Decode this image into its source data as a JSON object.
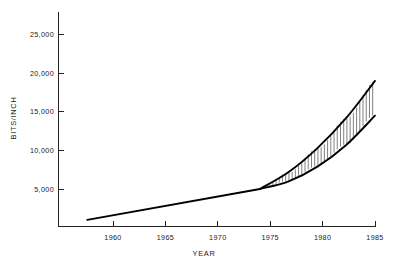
{
  "chart_data": {
    "type": "line",
    "title": "",
    "xlabel": "YEAR",
    "ylabel": "BITS/INCH",
    "xlim": [
      1957.5,
      1985
    ],
    "ylim": [
      0,
      27000
    ],
    "xticks": [
      1960,
      1965,
      1970,
      1975,
      1980,
      1985
    ],
    "xtick_labels": [
      "1960",
      "1965",
      "1970",
      "1975",
      "1980",
      "1985"
    ],
    "yticks": [
      5000,
      10000,
      15000,
      20000,
      25000
    ],
    "ytick_labels": [
      "5,000",
      "10,000",
      "15,000",
      "20,000",
      "25,000"
    ],
    "grid": false,
    "legend": null,
    "annotations": [],
    "series": [
      {
        "name": "historical",
        "x": [
          1960,
          1975
        ],
        "values": [
          1000,
          5000
        ]
      },
      {
        "name": "projection-upper-bound",
        "x": [
          1975,
          1977.5,
          1980,
          1982.5,
          1985
        ],
        "values": [
          5000,
          7200,
          10300,
          14200,
          19000
        ]
      },
      {
        "name": "projection-lower-bound",
        "x": [
          1975,
          1977.5,
          1980,
          1982.5,
          1985
        ],
        "values": [
          5000,
          6000,
          7900,
          10700,
          14500
        ]
      }
    ],
    "hatched_band": {
      "between": [
        "projection-upper-bound",
        "projection-lower-bound"
      ],
      "pattern": "vertical-lines",
      "spacing_years": 0.28,
      "color": "#3a3a3a"
    },
    "colors": {
      "line": "#000000",
      "axis": "#222222",
      "hatch": "#3a3a3a",
      "background": "#ffffff"
    }
  },
  "axes": {
    "y_title": "BITS/INCH",
    "x_title": "YEAR"
  }
}
